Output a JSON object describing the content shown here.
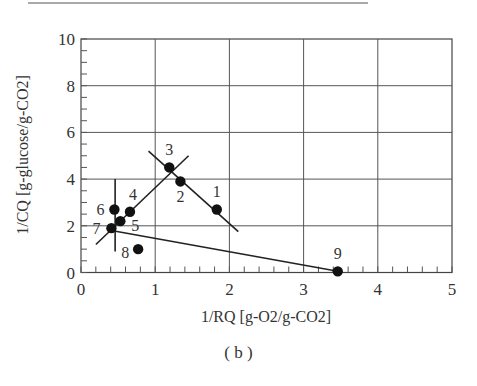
{
  "chart_data": {
    "type": "scatter",
    "title": "",
    "caption": "( b )",
    "xlabel": "1/RQ [g-O2/g-CO2]",
    "ylabel": "1/CQ [g-glucose/g-CO2]",
    "xlim": [
      0,
      5
    ],
    "ylim": [
      0,
      10
    ],
    "x_ticks": [
      "0",
      "1",
      "2",
      "3",
      "4",
      "5"
    ],
    "y_ticks": [
      "0",
      "2",
      "4",
      "6",
      "8",
      "10"
    ],
    "grid": true,
    "points": [
      {
        "label": "1",
        "x": 1.83,
        "y": 2.7
      },
      {
        "label": "2",
        "x": 1.34,
        "y": 3.9
      },
      {
        "label": "3",
        "x": 1.19,
        "y": 4.5
      },
      {
        "label": "4",
        "x": 0.66,
        "y": 2.6
      },
      {
        "label": "5",
        "x": 0.53,
        "y": 2.2
      },
      {
        "label": "6",
        "x": 0.45,
        "y": 2.7
      },
      {
        "label": "7",
        "x": 0.41,
        "y": 1.9
      },
      {
        "label": "8",
        "x": 0.77,
        "y": 1.0
      },
      {
        "label": "9",
        "x": 3.46,
        "y": 0.05
      }
    ],
    "lines": [
      {
        "name": "line-3-2-1",
        "x1": 0.91,
        "y1": 5.2,
        "x2": 2.12,
        "y2": 1.75
      },
      {
        "name": "line-7-4-3",
        "x1": 0.2,
        "y1": 1.2,
        "x2": 1.45,
        "y2": 5.0
      },
      {
        "name": "vertical-at-6-7",
        "x1": 0.46,
        "y1": 4.0,
        "x2": 0.46,
        "y2": 0.9
      },
      {
        "name": "line-7-9",
        "x1": 0.41,
        "y1": 1.8,
        "x2": 3.46,
        "y2": 0.05
      }
    ],
    "legend": null
  }
}
